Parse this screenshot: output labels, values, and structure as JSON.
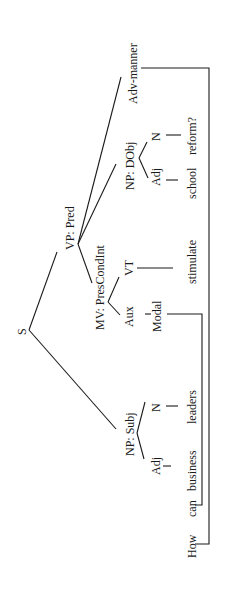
{
  "diagram": {
    "type": "syntax-tree",
    "orientation": "rotated-90-ccw",
    "sentence": "How can business leaders stimulate school reform?",
    "nodes": {
      "root": "S",
      "vp": "VP: Pred",
      "mv": "MV: PresCondInt",
      "aux": "Aux",
      "modal": "Modal",
      "vt": "VT",
      "np_dobj": "NP: DObj",
      "dobj_adj": "Adj",
      "dobj_n": "N",
      "adv": "Adv-manner",
      "np_subj": "NP: Subj",
      "subj_adj": "Adj",
      "subj_n": "N"
    },
    "words": {
      "how": "How",
      "can": "can",
      "business": "business",
      "leaders": "leaders",
      "stimulate": "stimulate",
      "school": "school",
      "reform": "reform?"
    },
    "edges": [
      [
        "S",
        "VP: Pred"
      ],
      [
        "S",
        "NP: Subj"
      ],
      [
        "VP: Pred",
        "MV: PresCondInt"
      ],
      [
        "VP: Pred",
        "NP: DObj"
      ],
      [
        "VP: Pred",
        "Adv-manner"
      ],
      [
        "MV: PresCondInt",
        "Aux"
      ],
      [
        "MV: PresCondInt",
        "VT"
      ],
      [
        "Aux",
        "Modal"
      ],
      [
        "Modal",
        "can"
      ],
      [
        "VT",
        "stimulate"
      ],
      [
        "NP: DObj",
        "Adj"
      ],
      [
        "NP: DObj",
        "N"
      ],
      [
        "Adj",
        "school"
      ],
      [
        "N",
        "reform?"
      ],
      [
        "NP: Subj",
        "Adj"
      ],
      [
        "NP: Subj",
        "N"
      ],
      [
        "Adj",
        "business"
      ],
      [
        "N",
        "leaders"
      ],
      [
        "Adv-manner",
        "How"
      ]
    ]
  }
}
